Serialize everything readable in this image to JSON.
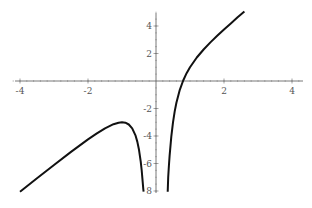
{
  "chart_data": {
    "type": "line",
    "title": "",
    "xlabel": "",
    "ylabel": "",
    "function_shape": "y = 2x - 1/x^2",
    "xlim": [
      -4.2,
      4.4
    ],
    "ylim": [
      -8,
      5
    ],
    "grid": false,
    "legend": null,
    "x_ticks": [
      -4,
      -2,
      2,
      4
    ],
    "x_tick_labels": [
      "-4",
      "-2",
      "2",
      "4"
    ],
    "y_ticks": [
      4,
      2,
      -2,
      -4,
      -6,
      -8
    ],
    "y_tick_labels": [
      "4",
      "2",
      "-2",
      "-4",
      "-6",
      "8"
    ],
    "series": [
      {
        "name": "left-branch",
        "color": "#111111",
        "x": [
          -4.0,
          -3.5,
          -3.0,
          -2.5,
          -2.0,
          -1.75,
          -1.5,
          -1.25,
          -1.1,
          -1.0,
          -0.9,
          -0.8,
          -0.7,
          -0.6,
          -0.55,
          -0.5,
          -0.45,
          -0.42,
          -0.39,
          -0.375
        ],
        "y": [
          -8.06,
          -7.08,
          -6.11,
          -5.16,
          -4.25,
          -3.83,
          -3.44,
          -3.14,
          -3.03,
          -3.0,
          -3.03,
          -3.16,
          -3.44,
          -3.98,
          -4.41,
          -5.0,
          -5.84,
          -6.51,
          -7.35,
          -7.86
        ]
      },
      {
        "name": "right-branch",
        "color": "#111111",
        "x": [
          0.36,
          0.38,
          0.4,
          0.45,
          0.5,
          0.55,
          0.6,
          0.7,
          0.8,
          0.9,
          1.0,
          1.2,
          1.4,
          1.6,
          1.8,
          2.0,
          2.2,
          2.4,
          2.6
        ],
        "y": [
          -7.0,
          -6.17,
          -5.45,
          -4.04,
          -3.0,
          -2.21,
          -1.58,
          -0.64,
          0.04,
          0.57,
          1.0,
          1.71,
          2.29,
          2.81,
          3.29,
          3.75,
          4.19,
          4.63,
          5.05
        ]
      }
    ]
  }
}
